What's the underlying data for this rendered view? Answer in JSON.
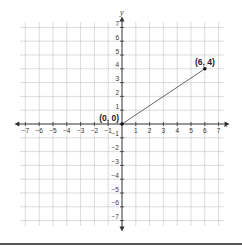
{
  "chart_data": {
    "type": "line",
    "title": "",
    "xlabel": "x",
    "ylabel": "y",
    "xlim": [
      -7,
      7
    ],
    "ylim": [
      -7,
      7
    ],
    "grid": true,
    "x_ticks": [
      -7,
      -6,
      -5,
      -4,
      -3,
      -2,
      -1,
      1,
      2,
      3,
      4,
      5,
      6,
      7
    ],
    "y_ticks": [
      7,
      6,
      5,
      4,
      3,
      2,
      1,
      -1,
      -2,
      -3,
      -4,
      -5,
      -6,
      -7
    ],
    "x_tick_labels": [
      "−7",
      "−6",
      "−5",
      "−4",
      "−3",
      "−2",
      "−1",
      "1",
      "2",
      "3",
      "4",
      "5",
      "6",
      "7"
    ],
    "y_tick_labels": [
      "7",
      "6",
      "5",
      "4",
      "3",
      "2",
      "1",
      "−1",
      "−2",
      "−3",
      "−4",
      "−5",
      "−6",
      "−7"
    ],
    "series": [
      {
        "name": "segment",
        "x": [
          0,
          6
        ],
        "y": [
          0,
          4
        ]
      }
    ],
    "points": [
      {
        "x": 0,
        "y": 0,
        "label": "(0, 0)"
      },
      {
        "x": 6,
        "y": 4,
        "label": "(6, 4)"
      }
    ],
    "colors": {
      "grid": "#9a9a9a",
      "axis": "#333333",
      "segment": "#555555",
      "point": "#111111"
    }
  }
}
